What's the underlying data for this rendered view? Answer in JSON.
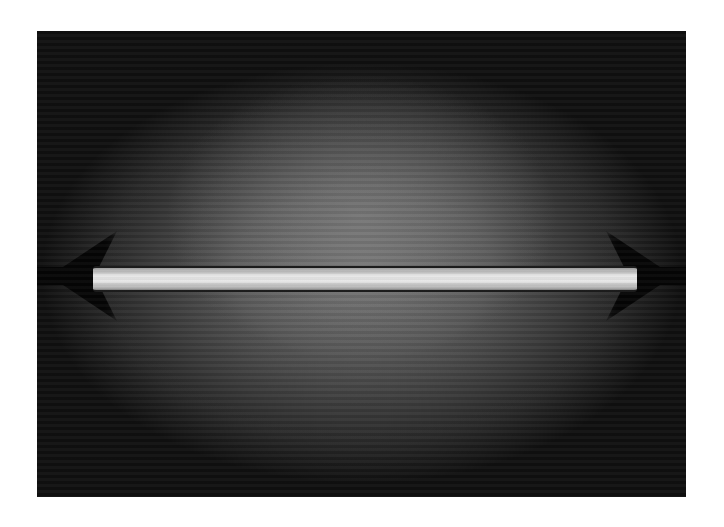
{
  "image": {
    "subject": "fluorescent lamp tube",
    "description": "Black-and-white photograph of a horizontal glowing fluorescent tube against a dark gradient background with a white border",
    "colors": {
      "border": "#ffffff",
      "background_dark": "#101010",
      "background_mid": "#6e6e6e",
      "tube_glow": "#eeeeee"
    }
  }
}
